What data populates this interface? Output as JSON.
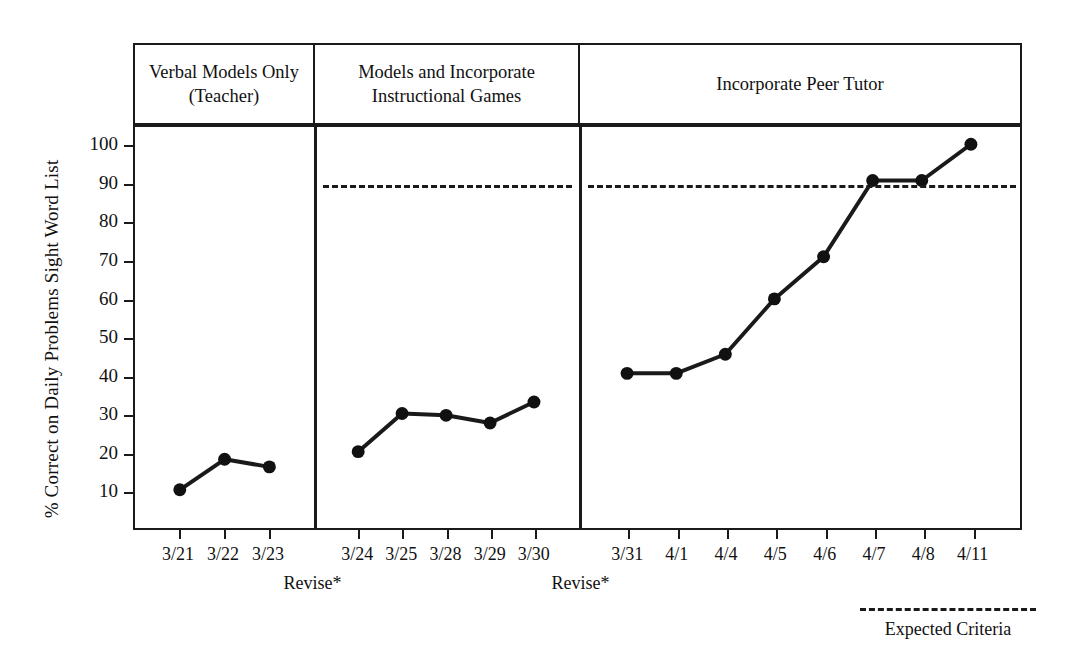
{
  "chart_data": {
    "type": "line",
    "title": "",
    "xlabel": "",
    "ylabel": "% Correct on Daily Problems Sight Word List",
    "ylim": [
      0,
      105
    ],
    "yticks": [
      10,
      20,
      30,
      40,
      50,
      60,
      70,
      80,
      90,
      100
    ],
    "ytick_labels": [
      "10",
      "20",
      "30",
      "40",
      "50",
      "60",
      "70",
      "80",
      "90",
      "100"
    ],
    "grid": false,
    "legend_position": "bottom-right",
    "x": [
      "3/21",
      "3/22",
      "3/23",
      "3/24",
      "3/25",
      "3/28",
      "3/29",
      "3/30",
      "3/31",
      "4/1",
      "4/4",
      "4/5",
      "4/6",
      "4/7",
      "4/8",
      "4/11"
    ],
    "series": [
      {
        "name": "% Correct on Daily Problems Sight Word List",
        "values": [
          10,
          18,
          16,
          20,
          30,
          29.5,
          27.5,
          33,
          40.5,
          40.5,
          45.5,
          60,
          71,
          91,
          91,
          100.5
        ]
      }
    ],
    "phases": [
      {
        "label": "Verbal Models Only\n(Teacher)",
        "label_lines": [
          "Verbal Models Only",
          "(Teacher)"
        ],
        "x_points": [
          "3/21",
          "3/22",
          "3/23"
        ],
        "values": [
          10,
          18,
          16
        ],
        "criteria_line": null
      },
      {
        "label": "Models and Incorporate\nInstructional Games",
        "label_lines": [
          "Models and Incorporate",
          "Instructional Games"
        ],
        "x_points": [
          "3/24",
          "3/25",
          "3/28",
          "3/29",
          "3/30"
        ],
        "values": [
          20,
          30,
          29.5,
          27.5,
          33
        ],
        "criteria_line": 90
      },
      {
        "label": "Incorporate Peer Tutor",
        "label_lines": [
          "Incorporate Peer Tutor"
        ],
        "x_points": [
          "3/31",
          "4/1",
          "4/4",
          "4/5",
          "4/6",
          "4/7",
          "4/8",
          "4/11"
        ],
        "values": [
          40.5,
          40.5,
          45.5,
          60,
          71,
          91,
          91,
          100.5
        ],
        "criteria_line": 90
      }
    ],
    "annotations": [
      {
        "text": "Revise*",
        "after_x": "3/23"
      },
      {
        "text": "Revise*",
        "after_x": "3/30"
      }
    ],
    "legend": [
      {
        "label": "Expected Criteria",
        "style": "dashed",
        "color": "#1a1a1a"
      }
    ],
    "colors": {
      "line": "#1a1a1a",
      "marker": "#111111",
      "axis": "#1a1a1a",
      "background": "#ffffff"
    }
  },
  "axes": {
    "y_title": "% Correct on Daily Problems Sight Word List"
  },
  "legend": {
    "criteria_label": "Expected Criteria"
  }
}
